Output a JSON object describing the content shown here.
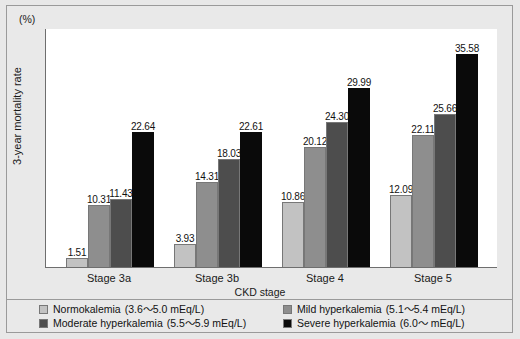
{
  "chart_data": {
    "type": "bar",
    "title": "",
    "xlabel": "CKD stage",
    "ylabel": "3-year mortality rate",
    "yunit": "(%)",
    "ylim": [
      0,
      40
    ],
    "ytick_labels": [
      "40",
      "35",
      "30",
      "25",
      "20",
      "15",
      "10",
      "5",
      "0"
    ],
    "yticks": [
      40,
      35,
      30,
      25,
      20,
      15,
      10,
      5,
      0
    ],
    "grid": false,
    "legend_position": "bottom",
    "categories": [
      "Stage 3a",
      "Stage 3b",
      "Stage 4",
      "Stage 5"
    ],
    "series": [
      {
        "name": "Normokalemia",
        "range": "(3.6～5.0 mEq/L)",
        "color": "#c2c2c2",
        "values": [
          1.51,
          3.93,
          10.86,
          12.09
        ],
        "labels": [
          "1.51",
          "3.93",
          "10.86",
          "12.09"
        ]
      },
      {
        "name": "Mild hyperkalemia",
        "range": "(5.1～5.4 mEq/L)",
        "color": "#8e8e8e",
        "values": [
          10.31,
          14.31,
          20.12,
          22.11
        ],
        "labels": [
          "10.31",
          "14.31",
          "20.12",
          "22.11"
        ]
      },
      {
        "name": "Moderate hyperkalemia",
        "range": "(5.5～5.9 mEq/L)",
        "color": "#4d4d4d",
        "values": [
          11.43,
          18.03,
          24.3,
          25.66
        ],
        "labels": [
          "11.43",
          "18.03",
          "24.30",
          "25.66"
        ]
      },
      {
        "name": "Severe hyperkalemia",
        "range": "(6.0～ mEq/L)",
        "color": "#0a0a0a",
        "values": [
          22.64,
          22.61,
          29.99,
          35.58
        ],
        "labels": [
          "22.64",
          "22.61",
          "29.99",
          "35.58"
        ]
      }
    ]
  },
  "axes": {
    "y_unit": "(%)",
    "y_title": "3-year mortality rate",
    "x_title": "CKD stage",
    "y_labels": [
      "40",
      "35",
      "30",
      "25",
      "20",
      "15",
      "10",
      "5",
      "0"
    ],
    "x_labels": [
      "Stage 3a",
      "Stage 3b",
      "Stage 4",
      "Stage 5"
    ]
  },
  "legend": {
    "items": [
      {
        "label": "Normokalemia",
        "range": "(3.6～5.0 mEq/L)",
        "color": "#c2c2c2"
      },
      {
        "label": "Mild hyperkalemia",
        "range": "(5.1～5.4 mEq/L)",
        "color": "#8e8e8e"
      },
      {
        "label": "Moderate hyperkalemia",
        "range": "(5.5～5.9 mEq/L)",
        "color": "#4d4d4d"
      },
      {
        "label": "Severe hyperkalemia",
        "range": "(6.0～ mEq/L)",
        "color": "#0a0a0a"
      }
    ]
  }
}
